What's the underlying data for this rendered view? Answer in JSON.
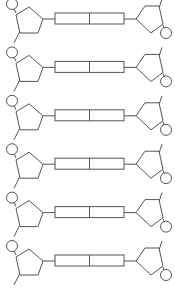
{
  "diagram": {
    "colors": {
      "stroke": "#555555",
      "fill": "#ffffff",
      "background": "#ffffff"
    },
    "rows": 6,
    "row_spacing": 48.4,
    "first_row_y": 18,
    "components": {
      "left_strand": {
        "sugar": "pentagon",
        "phosphate": "circle"
      },
      "right_strand": {
        "sugar": "pentagon",
        "phosphate": "circle"
      },
      "base_pair": {
        "shape": "rectangle split into two halves"
      }
    }
  }
}
